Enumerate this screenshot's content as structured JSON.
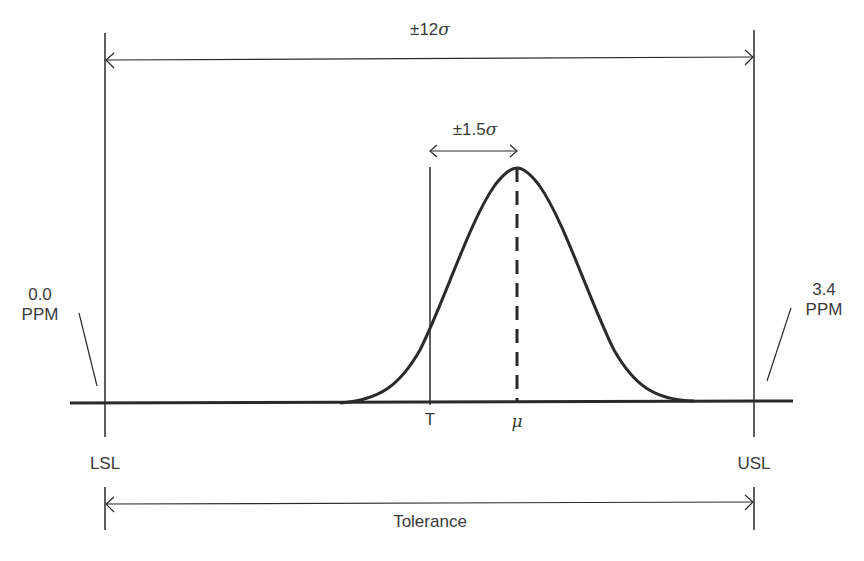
{
  "diagram": {
    "type": "six-sigma-process-capability",
    "top_span": {
      "prefix": "±12",
      "symbol": "σ"
    },
    "shift_span": {
      "prefix": "±1.5",
      "symbol": "σ"
    },
    "left_ppm": {
      "value": "0.0",
      "unit": "PPM"
    },
    "right_ppm": {
      "value": "3.4",
      "unit": "PPM"
    },
    "target_label": "T",
    "mean_label": "μ",
    "lsl_label": "LSL",
    "usl_label": "USL",
    "tolerance_label": "Tolerance",
    "colors": {
      "line": "#2a2a2a",
      "text": "#3a3a3a",
      "background": "#ffffff"
    }
  }
}
